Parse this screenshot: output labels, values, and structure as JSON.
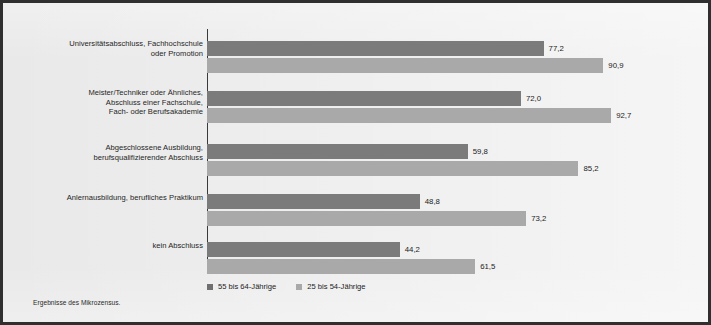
{
  "chart_data": {
    "type": "bar",
    "orientation": "horizontal",
    "title": "",
    "subtitle": "",
    "xlabel": "",
    "ylabel": "",
    "xlim": [
      0,
      100
    ],
    "grid": false,
    "legend_position": "bottom",
    "value_format": "comma-decimal",
    "categories": [
      "Universitätsabschluss, Fachhochschule\noder Promotion",
      "Meister/Techniker oder Ähnliches,\nAbschluss einer Fachschule,\nFach- oder Berufsakademie",
      "Abgeschlossene Ausbildung,\nberufsqualifizierender Abschluss",
      "Anlernausbildung, berufliches Praktikum",
      "kein Abschluss"
    ],
    "category_lines": [
      [
        "Universitätsabschluss, Fachhochschule",
        "oder Promotion"
      ],
      [
        "Meister/Techniker oder Ähnliches,",
        "Abschluss einer Fachschule,",
        "Fach- oder Berufsakademie"
      ],
      [
        "Abgeschlossene Ausbildung,",
        "berufsqualifizierender Abschluss"
      ],
      [
        "Anlernausbildung, berufliches Praktikum"
      ],
      [
        "kein Abschluss"
      ]
    ],
    "series": [
      {
        "name": "55 bis 64-Jährige",
        "color": "#7b7b7b",
        "values": [
          77.2,
          72.0,
          59.8,
          48.8,
          44.2
        ],
        "labels": [
          "77,2",
          "72,0",
          "59,8",
          "48,8",
          "44,2"
        ]
      },
      {
        "name": "25 bis 54-Jährige",
        "color": "#a9a9a9",
        "values": [
          90.9,
          92.7,
          85.2,
          73.2,
          61.5
        ],
        "labels": [
          "90,9",
          "92,7",
          "85,2",
          "73,2",
          "61,5"
        ]
      }
    ]
  },
  "legend": {
    "items": [
      {
        "label": "55 bis 64-Jährige",
        "color": "#7b7b7b"
      },
      {
        "label": "25 bis 54-Jährige",
        "color": "#a9a9a9"
      }
    ]
  },
  "footer": {
    "source_note": "Ergebnisse des Mikrozensus."
  },
  "colors": {
    "series_dark": "#7b7b7b",
    "series_light": "#a9a9a9",
    "background": "#e9e9e9",
    "frame": "#2f2f2f",
    "axis": "#3a3a3a",
    "text": "#1c1c1c"
  }
}
